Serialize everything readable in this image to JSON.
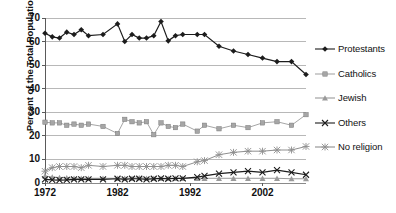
{
  "chart_data": {
    "type": "line",
    "title": "",
    "xlabel": "",
    "ylabel": "Percent of the Total Population",
    "xlim": [
      1972,
      2008
    ],
    "ylim": [
      0,
      70
    ],
    "ytick_labels": [
      "0",
      "10",
      "20",
      "30",
      "40",
      "50",
      "60",
      "70"
    ],
    "yticks": [
      0,
      10,
      20,
      30,
      40,
      50,
      60,
      70
    ],
    "xtick_labels": [
      "1972",
      "1982",
      "1992",
      "2002"
    ],
    "xticks": [
      1972,
      1982,
      1992,
      2002
    ],
    "grid": "horizontal",
    "legend_position": "right",
    "x": [
      1972,
      1973,
      1974,
      1975,
      1976,
      1977,
      1978,
      1980,
      1982,
      1983,
      1984,
      1985,
      1986,
      1987,
      1988,
      1989,
      1990,
      1991,
      1993,
      1994,
      1996,
      1998,
      2000,
      2002,
      2004,
      2006,
      2008
    ],
    "series": [
      {
        "name": "Protestants",
        "marker": "diamond",
        "color": "#1c1c1c",
        "values": [
          63.5,
          62.0,
          61.5,
          64.0,
          63.0,
          65.0,
          62.5,
          63.0,
          67.5,
          60.0,
          63.0,
          61.5,
          61.5,
          62.5,
          68.5,
          60.3,
          62.5,
          63.0,
          63.0,
          63.0,
          58.0,
          56.0,
          54.5,
          53.0,
          51.5,
          51.5,
          46.0
        ]
      },
      {
        "name": "Catholics",
        "marker": "square",
        "color": "#a6a6a6",
        "values": [
          25.8,
          25.5,
          25.5,
          24.5,
          25.0,
          24.5,
          25.0,
          24.0,
          21.0,
          27.0,
          26.0,
          25.5,
          26.0,
          20.5,
          25.5,
          24.0,
          23.5,
          25.0,
          22.0,
          24.5,
          23.0,
          24.5,
          23.5,
          25.5,
          26.0,
          24.5,
          29.0
        ]
      },
      {
        "name": "Jewish",
        "marker": "triangle",
        "color": "#9a9a9a",
        "values": [
          3.0,
          2.5,
          2.3,
          2.2,
          2.0,
          2.0,
          2.0,
          2.0,
          2.0,
          2.0,
          2.0,
          2.2,
          2.0,
          2.0,
          2.0,
          2.0,
          2.0,
          2.0,
          2.0,
          2.0,
          2.0,
          2.0,
          2.0,
          2.0,
          2.0,
          1.8,
          1.8
        ]
      },
      {
        "name": "Others",
        "marker": "cross",
        "color": "#1c1c1c",
        "values": [
          1.5,
          1.3,
          1.2,
          1.3,
          1.5,
          1.5,
          1.5,
          1.5,
          1.8,
          1.5,
          1.8,
          1.8,
          1.5,
          1.8,
          2.0,
          1.8,
          2.0,
          2.0,
          2.5,
          3.0,
          4.0,
          4.5,
          5.0,
          4.5,
          5.5,
          4.5,
          3.5
        ]
      },
      {
        "name": "No religion",
        "marker": "asterisk",
        "color": "#8f8f8f",
        "values": [
          5.0,
          6.5,
          7.0,
          7.0,
          7.0,
          6.5,
          7.5,
          7.0,
          7.5,
          7.5,
          7.0,
          7.0,
          7.0,
          7.0,
          7.0,
          7.5,
          7.5,
          7.0,
          9.0,
          9.5,
          12.0,
          13.0,
          13.5,
          13.5,
          14.0,
          14.0,
          15.5
        ]
      }
    ]
  },
  "axis": {
    "ylabel": "Percent of the Total Population"
  },
  "legend": {
    "items": [
      {
        "label": "Protestants"
      },
      {
        "label": "Catholics"
      },
      {
        "label": "Jewish"
      },
      {
        "label": "Others"
      },
      {
        "label": "No religion"
      }
    ]
  }
}
